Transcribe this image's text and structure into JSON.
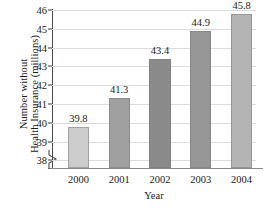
{
  "chart_data": {
    "type": "bar",
    "title": "",
    "categories": [
      "2000",
      "2001",
      "2002",
      "2003",
      "2004"
    ],
    "values": [
      39.8,
      41.3,
      43.4,
      44.9,
      45.8
    ],
    "value_labels": [
      "39.8",
      "41.3",
      "43.4",
      "44.9",
      "45.8"
    ],
    "xlabel": "Year",
    "ylabel": "Number without Health Insurance (millions)",
    "ylabel_line1": "Number without",
    "ylabel_line2": "Health Insurance (millions)",
    "ylim": [
      37.6,
      46
    ],
    "y_ticks": [
      46,
      45,
      44,
      43,
      42,
      41,
      40,
      39,
      38
    ],
    "y_tick_labels": [
      "46",
      "45",
      "44",
      "43",
      "42",
      "41",
      "40",
      "39",
      "38"
    ],
    "grid": true,
    "grid_axis": "y",
    "legend": null,
    "axis_break": true,
    "bar_colors": [
      "#cccccc",
      "#a0a0a0",
      "#8a8a8a",
      "#969696",
      "#b4b4b4"
    ],
    "colors": {
      "background": "#ffffff",
      "gridline": "#dcdcdc",
      "axis": "#4a4a4a",
      "text": "#1a1a1a"
    }
  }
}
